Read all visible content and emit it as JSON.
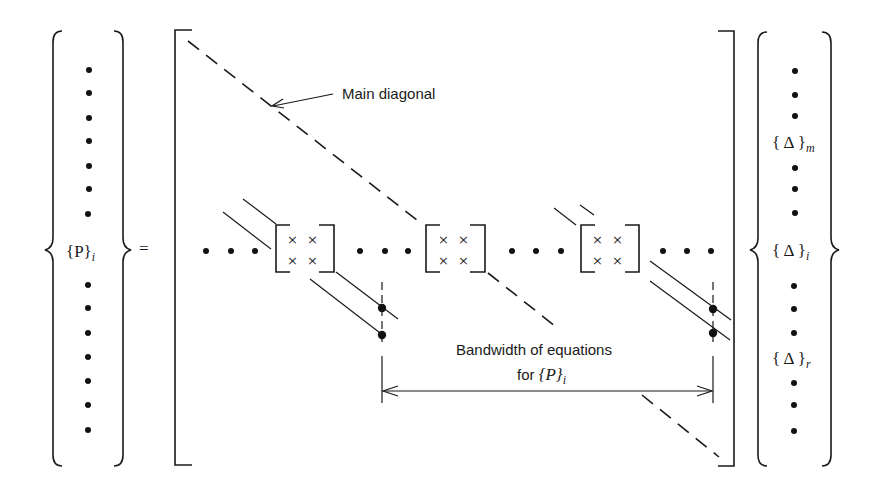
{
  "diagram": {
    "type": "banded-stiffness-matrix-equation",
    "left_vector": {
      "label_main": "{P}",
      "label_sub": "i",
      "dots_above": 7,
      "dots_below": 7
    },
    "equals_sign": "=",
    "matrix": {
      "main_diagonal_label": "Main diagonal",
      "submatrix_entries": [
        "×",
        "×",
        "×",
        "×"
      ],
      "submatrix_count": 3,
      "row_dots": "• • •",
      "bandwidth_label_line1": "Bandwidth of equations",
      "bandwidth_label_line2_prefix": "for ",
      "bandwidth_label_math": "{P}",
      "bandwidth_label_sub": "i"
    },
    "right_vector": {
      "entries": [
        {
          "main": "{ Δ }",
          "sub": "m"
        },
        {
          "main": "{ Δ }",
          "sub": "i"
        },
        {
          "main": "{ Δ }",
          "sub": "r"
        }
      ]
    },
    "colors": {
      "ink": "#1a1a1a",
      "background": "#ffffff"
    }
  }
}
